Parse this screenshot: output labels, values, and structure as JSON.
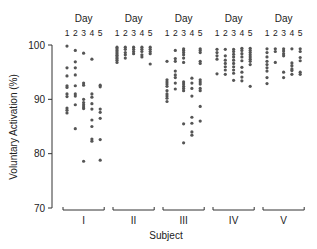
{
  "chart_data": {
    "type": "scatter",
    "title": "",
    "xlabel": "Subject",
    "ylabel": "Voluntary Activation (%)",
    "ylim": [
      70,
      100
    ],
    "yticks": [
      70,
      80,
      90,
      100
    ],
    "grid": false,
    "legend": null,
    "group_header": "Day",
    "day_labels": [
      "1",
      "2",
      "3",
      "4",
      "5"
    ],
    "categories": [
      "I",
      "II",
      "III",
      "IV",
      "V"
    ],
    "subjects": [
      {
        "name": "I",
        "days": [
          [
            99.8,
            95.8,
            94.3,
            92.5,
            92.2,
            91.0,
            90.5,
            88.4,
            88.0,
            87.5
          ],
          [
            99.0,
            96.9,
            95.8,
            94.5,
            92.5,
            91.0,
            90.6,
            89.0,
            84.6
          ],
          [
            98.5,
            93.0,
            92.6,
            90.0,
            89.4,
            89.0,
            88.6,
            88.3,
            78.6
          ],
          [
            97.4,
            91.0,
            90.4,
            89.2,
            88.2,
            86.2,
            85.0,
            82.7,
            82.3
          ],
          [
            92.6,
            92.3,
            88.2,
            87.6,
            86.5,
            82.6,
            78.8
          ]
        ]
      },
      {
        "name": "II",
        "days": [
          [
            99.6,
            99.3,
            99.0,
            98.7,
            98.4,
            98.1,
            97.8,
            97.5,
            97.2,
            96.8
          ],
          [
            99.6,
            99.2,
            98.6,
            98.2,
            97.6
          ],
          [
            99.6,
            99.2,
            98.8,
            98.4
          ],
          [
            99.6,
            99.2,
            98.8,
            98.2,
            97.8
          ],
          [
            99.6,
            99.2,
            98.8,
            98.4,
            96.5
          ]
        ]
      },
      {
        "name": "III",
        "days": [
          [
            97.0,
            93.6,
            93.2,
            92.8,
            92.4,
            91.6,
            91.0,
            90.6,
            90.2,
            89.6
          ],
          [
            99.0,
            97.5,
            97.0,
            95.2,
            94.5,
            94.0,
            93.0,
            91.9
          ],
          [
            99.3,
            99.0,
            98.6,
            98.2,
            97.6,
            96.8,
            93.2,
            92.8,
            92.4,
            92.0,
            91.6,
            85.5,
            82.0
          ],
          [
            93.9,
            93.0,
            92.0,
            90.6,
            86.7,
            85.6,
            84.0,
            83.4
          ],
          [
            99.3,
            99.0,
            98.6,
            97.0,
            96.6,
            93.6,
            93.2,
            92.8,
            92.0,
            91.6,
            88.7,
            86.0
          ]
        ]
      },
      {
        "name": "IV",
        "days": [
          [
            99.2,
            98.6,
            98.0,
            97.4,
            94.7
          ],
          [
            99.2,
            98.0,
            97.2,
            96.6,
            96.0,
            95.4,
            94.6
          ],
          [
            99.2,
            98.8,
            98.3,
            97.8,
            97.2,
            96.6,
            96.0,
            95.4,
            94.8,
            93.5
          ],
          [
            99.4,
            99.0,
            98.4,
            97.8,
            97.1,
            95.9,
            95.0,
            94.1,
            93.4
          ],
          [
            99.4,
            99.0,
            98.6,
            98.2,
            97.8,
            97.4,
            97.0,
            96.4,
            92.4
          ]
        ]
      },
      {
        "name": "V",
        "days": [
          [
            99.3,
            98.6,
            97.8,
            97.0,
            96.4,
            95.8,
            95.2,
            94.0,
            92.9
          ],
          [
            99.3,
            98.8,
            96.8
          ],
          [
            99.3,
            98.9,
            98.4,
            98.0,
            95.0,
            94.0
          ],
          [
            99.3,
            96.7,
            96.2,
            95.6,
            95.3,
            94.6
          ],
          [
            99.3,
            98.8,
            97.7,
            97.1,
            95.0,
            94.6
          ]
        ]
      }
    ]
  },
  "colors": {
    "dot": "#555555",
    "axis": "#333333",
    "text": "#222222"
  }
}
